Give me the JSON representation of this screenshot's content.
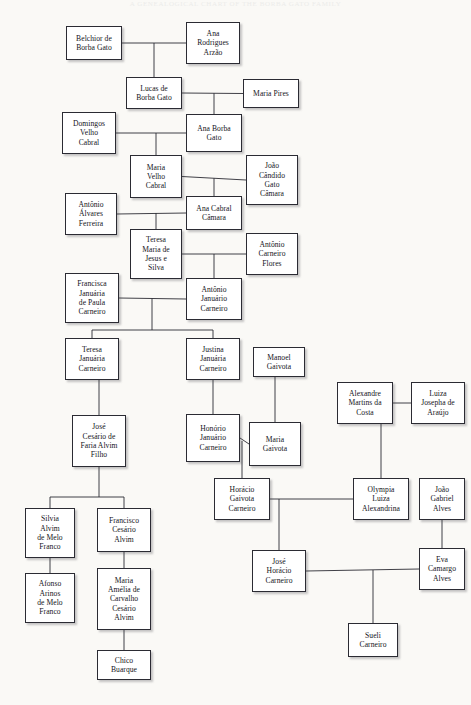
{
  "page": {
    "running_header": "A GENEALOGICAL CHART OF THE BORBA GATO FAMILY",
    "background_color": "#faf9f6",
    "node_fill": "#ffffff",
    "node_border_color": "#2b2b33",
    "line_color": "#2b2b33",
    "text_color": "#14141a"
  },
  "chart_data": {
    "type": "diagram",
    "diagram_kind": "genealogy-family-tree",
    "node_count": 36,
    "nodes": [
      {
        "id": "belchior",
        "label": "Belchior de\nBorba Gato",
        "x": 66,
        "y": 26,
        "w": 56,
        "h": 34
      },
      {
        "id": "ana_rodrigues",
        "label": "Ana\nRodrigues\nArzão",
        "x": 186,
        "y": 22,
        "w": 54,
        "h": 42
      },
      {
        "id": "lucas",
        "label": "Lucas de\nBorba Gato",
        "x": 126,
        "y": 77,
        "w": 56,
        "h": 32
      },
      {
        "id": "maria_pires",
        "label": "Maria Pires",
        "x": 243,
        "y": 79,
        "w": 56,
        "h": 29
      },
      {
        "id": "domingos",
        "label": "Domingos\nVelho\nCabral",
        "x": 62,
        "y": 112,
        "w": 54,
        "h": 42
      },
      {
        "id": "ana_borba",
        "label": "Ana Borba\nGato",
        "x": 186,
        "y": 114,
        "w": 56,
        "h": 38
      },
      {
        "id": "maria_velho",
        "label": "Maria\nVelho\nCabral",
        "x": 130,
        "y": 155,
        "w": 52,
        "h": 43
      },
      {
        "id": "joao_candido",
        "label": "João\nCândido\nGato\nCâmara",
        "x": 246,
        "y": 155,
        "w": 52,
        "h": 50
      },
      {
        "id": "antonio_alvares",
        "label": "Antônio\nÁlvares\nFerreira",
        "x": 65,
        "y": 193,
        "w": 52,
        "h": 42
      },
      {
        "id": "ana_cabral",
        "label": "Ana Cabral\nCâmara",
        "x": 186,
        "y": 196,
        "w": 56,
        "h": 34
      },
      {
        "id": "teresa_maria",
        "label": "Teresa\nMaria de\nJesus e\nSilva",
        "x": 130,
        "y": 229,
        "w": 52,
        "h": 50
      },
      {
        "id": "antonio_flores",
        "label": "Antônio\nCarneiro\nFlores",
        "x": 246,
        "y": 233,
        "w": 52,
        "h": 42
      },
      {
        "id": "francisca",
        "label": "Francisca\nJanuária\nde Paula\nCarneiro",
        "x": 65,
        "y": 273,
        "w": 54,
        "h": 50
      },
      {
        "id": "antonio_januario",
        "label": "Antônio\nJanuário\nCarneiro",
        "x": 186,
        "y": 278,
        "w": 56,
        "h": 42
      },
      {
        "id": "teresa_januaria",
        "label": "Teresa\nJanuária\nCarneiro",
        "x": 65,
        "y": 338,
        "w": 54,
        "h": 42
      },
      {
        "id": "justina",
        "label": "Justina\nJanuária\nCarneiro",
        "x": 186,
        "y": 338,
        "w": 54,
        "h": 42
      },
      {
        "id": "manoel_gaivota",
        "label": "Manoel\nGaivota",
        "x": 253,
        "y": 347,
        "w": 52,
        "h": 30
      },
      {
        "id": "alexandre",
        "label": "Alexandre\nMartins da\nCosta",
        "x": 337,
        "y": 382,
        "w": 56,
        "h": 42
      },
      {
        "id": "luiza_josepha",
        "label": "Luiza\nJosepha de\nAraújo",
        "x": 411,
        "y": 382,
        "w": 54,
        "h": 42
      },
      {
        "id": "jose_cesario",
        "label": "José\nCesário de\nFaria Alvim\nFilho",
        "x": 72,
        "y": 415,
        "w": 54,
        "h": 52
      },
      {
        "id": "honorio",
        "label": "Honório\nJanuário\nCarneiro",
        "x": 186,
        "y": 414,
        "w": 54,
        "h": 48
      },
      {
        "id": "maria_gaivota",
        "label": "Maria\nGaivota",
        "x": 249,
        "y": 422,
        "w": 52,
        "h": 44
      },
      {
        "id": "horacio",
        "label": "Horácio\nGaivota\nCarneiro",
        "x": 214,
        "y": 478,
        "w": 56,
        "h": 42
      },
      {
        "id": "olympia",
        "label": "Olympia\nLuiza\nAlexandrina",
        "x": 353,
        "y": 478,
        "w": 56,
        "h": 42
      },
      {
        "id": "joao_gabriel",
        "label": "João\nGabriel\nAlves",
        "x": 419,
        "y": 478,
        "w": 46,
        "h": 42
      },
      {
        "id": "silvia",
        "label": "Silvia\nAlvim\nde Melo\nFranco",
        "x": 25,
        "y": 508,
        "w": 50,
        "h": 50
      },
      {
        "id": "francisco_alvim",
        "label": "Francisco\nCesário\nAlvim",
        "x": 97,
        "y": 508,
        "w": 54,
        "h": 44
      },
      {
        "id": "jose_horacio",
        "label": "José\nHorácio\nCarneiro",
        "x": 252,
        "y": 550,
        "w": 54,
        "h": 42
      },
      {
        "id": "eva_camargo",
        "label": "Eva\nCamargo\nAlves",
        "x": 419,
        "y": 548,
        "w": 46,
        "h": 42
      },
      {
        "id": "afonso",
        "label": "Afonso\nArinos\nde Melo\nFranco",
        "x": 25,
        "y": 573,
        "w": 50,
        "h": 50
      },
      {
        "id": "maria_amelia",
        "label": "Maria\nAmélia de\nCarvalho\nCesário\nAlvim",
        "x": 97,
        "y": 568,
        "w": 54,
        "h": 62
      },
      {
        "id": "sueli",
        "label": "Sueli\nCarneiro",
        "x": 348,
        "y": 623,
        "w": 50,
        "h": 34
      },
      {
        "id": "chico",
        "label": "Chico\nBuarque",
        "x": 97,
        "y": 650,
        "w": 54,
        "h": 30
      }
    ],
    "edges": [
      {
        "from": "belchior",
        "to": "ana_rodrigues",
        "kind": "union"
      },
      {
        "from": "belchior+ana_rodrigues",
        "to": "lucas",
        "kind": "child"
      },
      {
        "from": "lucas",
        "to": "maria_pires",
        "kind": "union"
      },
      {
        "from": "lucas+maria_pires",
        "to": "ana_borba",
        "kind": "child"
      },
      {
        "from": "domingos",
        "to": "ana_borba",
        "kind": "union"
      },
      {
        "from": "domingos+ana_borba",
        "to": "maria_velho",
        "kind": "child"
      },
      {
        "from": "maria_velho",
        "to": "joao_candido",
        "kind": "union"
      },
      {
        "from": "maria_velho+joao_candido",
        "to": "ana_cabral",
        "kind": "child"
      },
      {
        "from": "antonio_alvares",
        "to": "ana_cabral",
        "kind": "union"
      },
      {
        "from": "antonio_alvares+ana_cabral",
        "to": "teresa_maria",
        "kind": "child"
      },
      {
        "from": "teresa_maria",
        "to": "antonio_flores",
        "kind": "union"
      },
      {
        "from": "teresa_maria+antonio_flores",
        "to": "antonio_januario",
        "kind": "child"
      },
      {
        "from": "francisca",
        "to": "antonio_januario",
        "kind": "union"
      },
      {
        "from": "francisca+antonio_januario",
        "to": "teresa_januaria",
        "kind": "child"
      },
      {
        "from": "francisca+antonio_januario",
        "to": "justina",
        "kind": "child"
      },
      {
        "from": "teresa_januaria",
        "to": "jose_cesario",
        "kind": "child"
      },
      {
        "from": "justina",
        "to": "honorio",
        "kind": "child"
      },
      {
        "from": "manoel_gaivota",
        "to": "maria_gaivota",
        "kind": "child"
      },
      {
        "from": "honorio",
        "to": "maria_gaivota",
        "kind": "union"
      },
      {
        "from": "honorio+maria_gaivota",
        "to": "horacio",
        "kind": "child"
      },
      {
        "from": "alexandre",
        "to": "luiza_josepha",
        "kind": "union"
      },
      {
        "from": "alexandre+luiza_josepha",
        "to": "olympia",
        "kind": "child"
      },
      {
        "from": "horacio",
        "to": "olympia",
        "kind": "union"
      },
      {
        "from": "horacio+olympia",
        "to": "jose_horacio",
        "kind": "child"
      },
      {
        "from": "joao_gabriel",
        "to": "eva_camargo",
        "kind": "child"
      },
      {
        "from": "jose_horacio",
        "to": "eva_camargo",
        "kind": "union"
      },
      {
        "from": "jose_horacio+eva_camargo",
        "to": "sueli",
        "kind": "child"
      },
      {
        "from": "jose_cesario",
        "to": "silvia",
        "kind": "child"
      },
      {
        "from": "jose_cesario",
        "to": "francisco_alvim",
        "kind": "child"
      },
      {
        "from": "silvia",
        "to": "afonso",
        "kind": "child"
      },
      {
        "from": "francisco_alvim",
        "to": "maria_amelia",
        "kind": "child"
      },
      {
        "from": "maria_amelia",
        "to": "chico",
        "kind": "child"
      }
    ]
  }
}
